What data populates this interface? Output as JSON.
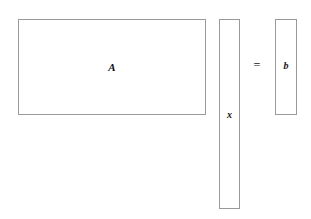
{
  "diagram": {
    "equation": "A x = b",
    "background_color": "#ffffff",
    "border_color": "#9a9a9a",
    "text_color": "#111111",
    "blocks": [
      {
        "id": "matrix-a",
        "label": "A",
        "role": "coefficient-matrix",
        "shape": "wide-rectangle",
        "x": 18,
        "y": 19,
        "width": 188,
        "height": 96
      },
      {
        "id": "vector-x",
        "label": "x",
        "role": "unknown-vector",
        "shape": "tall-column",
        "x": 219,
        "y": 19,
        "width": 21,
        "height": 190
      },
      {
        "id": "vector-b",
        "label": "b",
        "role": "right-hand-side-vector",
        "shape": "short-column",
        "x": 275,
        "y": 19,
        "width": 22,
        "height": 96
      }
    ],
    "operator": {
      "id": "equals-sign",
      "symbol": "=",
      "x": 257,
      "y": 65
    }
  }
}
